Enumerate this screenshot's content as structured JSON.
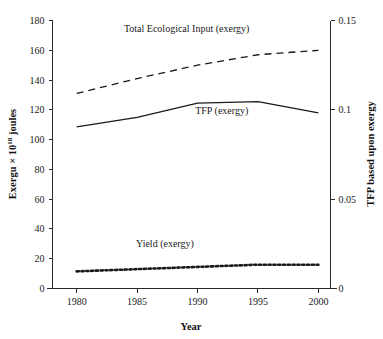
{
  "chart_data": {
    "type": "line",
    "title": "",
    "xlabel": "Year",
    "ylabel": "Exergu × 10¹⁸ joules",
    "ylabel_main": "Exergu × 10",
    "ylabel_exponent": "18",
    "ylabel_tail": " joules",
    "y2label": "TFP based upon exergy",
    "x": [
      1980,
      1985,
      1990,
      1995,
      2000
    ],
    "xlim": [
      1978,
      2001
    ],
    "ylim": [
      0,
      180
    ],
    "y2lim": [
      0,
      0.15
    ],
    "xticks": [
      1980,
      1985,
      1990,
      1995,
      2000
    ],
    "xticklabels": [
      "1980",
      "1985",
      "1990",
      "1995",
      "2000"
    ],
    "yticks": [
      0,
      20,
      40,
      60,
      80,
      100,
      120,
      140,
      160,
      180
    ],
    "yticklabels": [
      "0",
      "20",
      "40",
      "60",
      "80",
      "100",
      "120",
      "140",
      "160",
      "180"
    ],
    "y2ticks": [
      0,
      0.05,
      0.1,
      0.15
    ],
    "y2ticklabels": [
      "0",
      "0.05",
      "0.1",
      "0.15"
    ],
    "grid": false,
    "legend_position": "inline-annotations",
    "series": [
      {
        "name": "Total Ecological Input (exergy)",
        "style": "dashed",
        "axis": "left",
        "values": [
          131,
          141,
          150,
          157,
          160
        ],
        "label_x": 1989.1,
        "label_y": 172
      },
      {
        "name": "TFP (exergy)",
        "style": "solid",
        "axis": "left",
        "values": [
          108.5,
          115,
          124.5,
          125.5,
          118
        ],
        "label_x": 1992.0,
        "label_y": 117
      },
      {
        "name": "Yield (exergy)",
        "style": "dotted",
        "axis": "left",
        "values": [
          11.5,
          13,
          14.5,
          16,
          16
        ],
        "label_x": 1987.3,
        "label_y": 28
      }
    ]
  }
}
